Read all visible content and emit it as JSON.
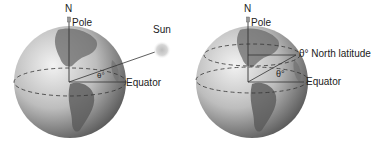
{
  "left_diagram": {
    "north_label": "N",
    "pole_label": "Pole",
    "sun_label": "Sun",
    "equator_label": "Equator",
    "angle_label": "θ°"
  },
  "right_diagram": {
    "north_label": "N",
    "pole_label": "Pole",
    "latitude_label": "θ° North latitude",
    "equator_label": "Equator",
    "angle_label": "θ°"
  },
  "colors": {
    "globe_light": "#e6e6e6",
    "globe_dark": "#6e6e6e",
    "land": "#5a5a5a",
    "line": "#333333",
    "sun": "#d0d0d0"
  }
}
